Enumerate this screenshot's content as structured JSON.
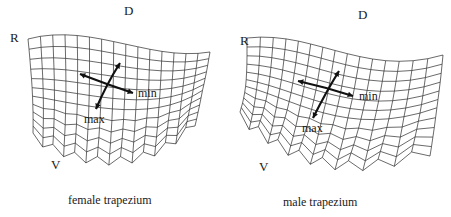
{
  "figure": {
    "panels": [
      {
        "id": "female",
        "caption": "female trapezium",
        "orientation_labels": {
          "dorsal": "D",
          "radial": "R",
          "volar": "V"
        },
        "arrow_labels": {
          "min": "min",
          "max": "max"
        }
      },
      {
        "id": "male",
        "caption": "male trapezium",
        "orientation_labels": {
          "dorsal": "D",
          "radial": "R",
          "volar": "V"
        },
        "arrow_labels": {
          "min": "min",
          "max": "max"
        }
      }
    ],
    "colors": {
      "mesh": "#2a2a2a",
      "arrow": "#111111",
      "text": "#1a1a1a",
      "background": "#ffffff"
    }
  }
}
